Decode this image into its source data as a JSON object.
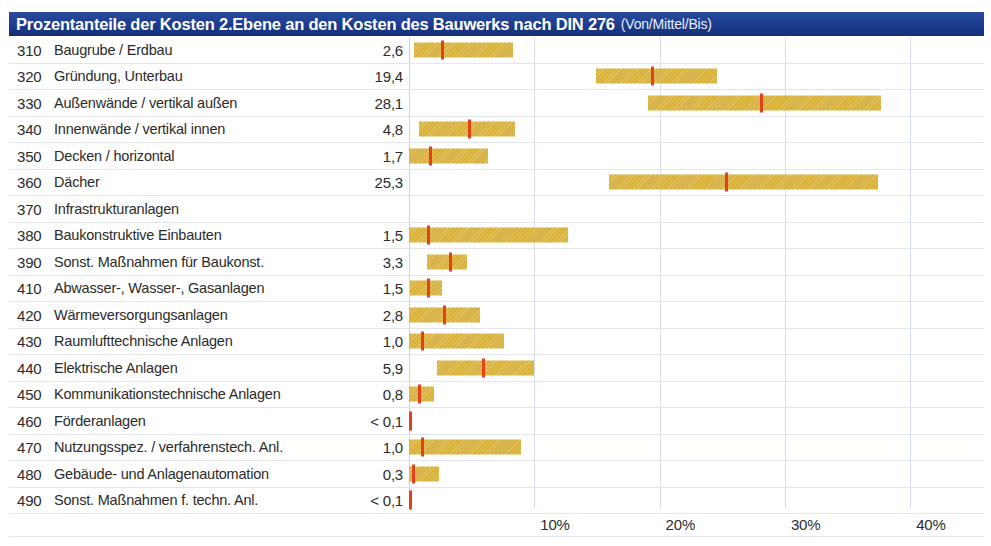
{
  "header": {
    "title": "Prozentanteile der Kosten 2.Ebene an den Kosten des Bauwerks nach DIN 276",
    "subtitle": "(Von/Mittel/Bis)"
  },
  "colors": {
    "header_bg": "#1b3b8f",
    "bar": "#d8b23d",
    "marker": "#e3411c",
    "grid": "#d8dee8",
    "text": "#2b2b2b"
  },
  "chart_data": {
    "type": "bar",
    "title": "Prozentanteile der Kosten 2.Ebene an den Kosten des Bauwerks nach DIN 276 (Von/Mittel/Bis)",
    "xlabel": "",
    "ylabel": "",
    "xlim": [
      0,
      41.5
    ],
    "grid": true,
    "legend": "none",
    "ticks": [
      "10%",
      "20%",
      "30%",
      "40%"
    ],
    "tick_values": [
      10,
      20,
      30,
      40
    ],
    "columns": [
      "Kostengruppe",
      "Bezeichnung",
      "Mittel",
      "Von",
      "Bis"
    ],
    "rows": [
      {
        "code": "310",
        "label": "Baugrube / Erdbau",
        "value": "2,6",
        "mittel": 2.6,
        "von": 0.4,
        "bis": 8.3
      },
      {
        "code": "320",
        "label": "Gründung, Unterbau",
        "value": "19,4",
        "mittel": 19.4,
        "von": 14.9,
        "bis": 24.6
      },
      {
        "code": "330",
        "label": "Außenwände / vertikal außen",
        "value": "28,1",
        "mittel": 28.1,
        "von": 19.1,
        "bis": 37.7
      },
      {
        "code": "340",
        "label": "Innenwände / vertikal innen",
        "value": "4,8",
        "mittel": 4.8,
        "von": 0.8,
        "bis": 8.5
      },
      {
        "code": "350",
        "label": "Decken / horizontal",
        "value": "1,7",
        "mittel": 1.7,
        "von": 0.0,
        "bis": 6.3
      },
      {
        "code": "360",
        "label": "Dächer",
        "value": "25,3",
        "mittel": 25.3,
        "von": 16.0,
        "bis": 37.4
      },
      {
        "code": "370",
        "label": "Infrastrukturanlagen",
        "value": "",
        "mittel": null,
        "von": null,
        "bis": null
      },
      {
        "code": "380",
        "label": "Baukonstruktive Einbauten",
        "value": "1,5",
        "mittel": 1.5,
        "von": 0.0,
        "bis": 12.7
      },
      {
        "code": "390",
        "label": "Sonst. Maßnahmen für Baukonst.",
        "value": "3,3",
        "mittel": 3.3,
        "von": 1.4,
        "bis": 4.6
      },
      {
        "code": "410",
        "label": "Abwasser-, Wasser-, Gasanlagen",
        "value": "1,5",
        "mittel": 1.5,
        "von": 0.1,
        "bis": 2.6
      },
      {
        "code": "420",
        "label": "Wärmeversorgungsanlagen",
        "value": "2,8",
        "mittel": 2.8,
        "von": 0.0,
        "bis": 5.7
      },
      {
        "code": "430",
        "label": "Raumlufttechnische Anlagen",
        "value": "1,0",
        "mittel": 1.0,
        "von": 0.0,
        "bis": 7.6
      },
      {
        "code": "440",
        "label": "Elektrische Anlagen",
        "value": "5,9",
        "mittel": 5.9,
        "von": 2.2,
        "bis": 10.0
      },
      {
        "code": "450",
        "label": "Kommunikationstechnische Anlagen",
        "value": "0,8",
        "mittel": 0.8,
        "von": 0.0,
        "bis": 2.0
      },
      {
        "code": "460",
        "label": "Förderanlagen",
        "value": "< 0,1",
        "mittel": 0.05,
        "von": 0.0,
        "bis": 0.1
      },
      {
        "code": "470",
        "label": "Nutzungsspez. / verfahrenstech. Anl.",
        "value": "1,0",
        "mittel": 1.0,
        "von": 0.0,
        "bis": 8.9
      },
      {
        "code": "480",
        "label": "Gebäude- und Anlagenautomation",
        "value": "0,3",
        "mittel": 0.3,
        "von": 0.0,
        "bis": 2.4
      },
      {
        "code": "490",
        "label": "Sonst. Maßnahmen f. techn. Anl.",
        "value": "< 0,1",
        "mittel": 0.05,
        "von": 0.0,
        "bis": 0.1
      }
    ]
  }
}
